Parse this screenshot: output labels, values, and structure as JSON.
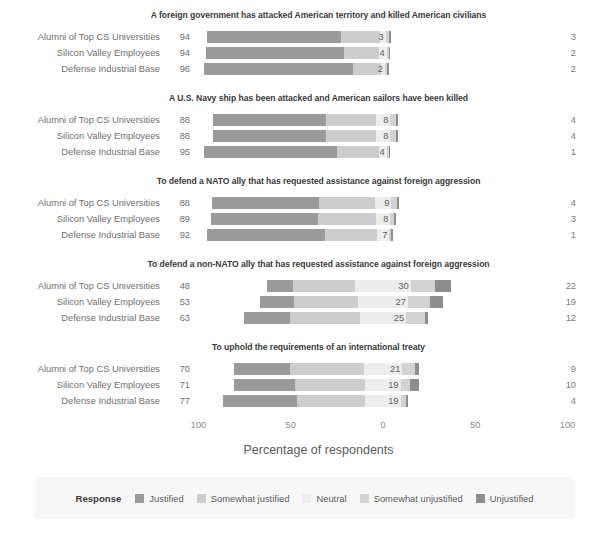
{
  "chart_data": {
    "type": "bar",
    "subtype": "diverging-stacked-likert",
    "title": "",
    "xlabel": "Percentage of respondents",
    "ylabel": "",
    "xticks": [
      {
        "label": "100",
        "value": -100
      },
      {
        "label": "50",
        "value": -50
      },
      {
        "label": "0",
        "value": 0
      },
      {
        "label": "50",
        "value": 50
      },
      {
        "label": "100",
        "value": 100
      }
    ],
    "xlim": [
      -100,
      100
    ],
    "grid": false,
    "legend_position": "bottom",
    "legend_title": "Response",
    "categories": [
      "Justified",
      "Somewhat justified",
      "Neutral",
      "Somewhat unjustified",
      "Unjustified"
    ],
    "category_colors": [
      "#9a9a9a",
      "#cdcdcd",
      "#ededed",
      "#d2d2d2",
      "#8d8d8d"
    ],
    "groups": [
      "Alumni of Top CS Universities",
      "Silicon Valley Employees",
      "Defense Industrial Base"
    ],
    "panels": [
      {
        "title": "A foreign government has attacked American territory and killed American civilians",
        "rows": [
          {
            "group": "Alumni of Top CS Universities",
            "left_total": 94,
            "neutral": 3,
            "right_total": 3,
            "values": {
              "justified": 73,
              "somewhat_justified": 21,
              "neutral": 3,
              "somewhat_unjustified": 2,
              "unjustified": 1
            }
          },
          {
            "group": "Silicon Valley Employees",
            "left_total": 94,
            "neutral": 4,
            "right_total": 2,
            "values": {
              "justified": 75,
              "somewhat_justified": 19,
              "neutral": 4,
              "somewhat_unjustified": 1,
              "unjustified": 1
            }
          },
          {
            "group": "Defense Industrial Base",
            "left_total": 96,
            "neutral": 2,
            "right_total": 2,
            "values": {
              "justified": 81,
              "somewhat_justified": 15,
              "neutral": 2,
              "somewhat_unjustified": 1,
              "unjustified": 1
            }
          }
        ]
      },
      {
        "title": "A U.S. Navy ship has been attacked and American sailors have been killed",
        "rows": [
          {
            "group": "Alumni of Top CS Universities",
            "left_total": 88,
            "neutral": 8,
            "right_total": 4,
            "values": {
              "justified": 61,
              "somewhat_justified": 27,
              "neutral": 8,
              "somewhat_unjustified": 3,
              "unjustified": 1
            }
          },
          {
            "group": "Silicon Valley Employees",
            "left_total": 88,
            "neutral": 8,
            "right_total": 4,
            "values": {
              "justified": 61,
              "somewhat_justified": 27,
              "neutral": 8,
              "somewhat_unjustified": 3,
              "unjustified": 1
            }
          },
          {
            "group": "Defense Industrial Base",
            "left_total": 95,
            "neutral": 4,
            "right_total": 1,
            "values": {
              "justified": 72,
              "somewhat_justified": 23,
              "neutral": 4,
              "somewhat_unjustified": 1,
              "unjustified": 0
            }
          }
        ]
      },
      {
        "title": "To defend a NATO ally that has requested assistance against foreign aggression",
        "rows": [
          {
            "group": "Alumni of Top CS Universities",
            "left_total": 88,
            "neutral": 9,
            "right_total": 4,
            "values": {
              "justified": 58,
              "somewhat_justified": 30,
              "neutral": 9,
              "somewhat_unjustified": 3,
              "unjustified": 1
            }
          },
          {
            "group": "Silicon Valley Employees",
            "left_total": 89,
            "neutral": 8,
            "right_total": 3,
            "values": {
              "justified": 58,
              "somewhat_justified": 31,
              "neutral": 8,
              "somewhat_unjustified": 2,
              "unjustified": 1
            }
          },
          {
            "group": "Defense Industrial Base",
            "left_total": 92,
            "neutral": 7,
            "right_total": 1,
            "values": {
              "justified": 64,
              "somewhat_justified": 28,
              "neutral": 7,
              "somewhat_unjustified": 1,
              "unjustified": 0
            }
          }
        ]
      },
      {
        "title": "To defend a non-NATO ally that has requested assistance against foreign aggression",
        "rows": [
          {
            "group": "Alumni of Top CS Universities",
            "left_total": 48,
            "neutral": 30,
            "right_total": 22,
            "values": {
              "justified": 14,
              "somewhat_justified": 34,
              "neutral": 30,
              "somewhat_unjustified": 13,
              "unjustified": 9
            }
          },
          {
            "group": "Silicon Valley Employees",
            "left_total": 53,
            "neutral": 27,
            "right_total": 19,
            "values": {
              "justified": 18,
              "somewhat_justified": 35,
              "neutral": 27,
              "somewhat_unjustified": 12,
              "unjustified": 7
            }
          },
          {
            "group": "Defense Industrial Base",
            "left_total": 63,
            "neutral": 25,
            "right_total": 12,
            "values": {
              "justified": 25,
              "somewhat_justified": 38,
              "neutral": 25,
              "somewhat_unjustified": 10,
              "unjustified": 2
            }
          }
        ]
      },
      {
        "title": "To uphold the requirements of an international treaty",
        "rows": [
          {
            "group": "Alumni of Top CS Universities",
            "left_total": 70,
            "neutral": 21,
            "right_total": 9,
            "values": {
              "justified": 30,
              "somewhat_justified": 40,
              "neutral": 21,
              "somewhat_unjustified": 7,
              "unjustified": 2
            }
          },
          {
            "group": "Silicon Valley Employees",
            "left_total": 71,
            "neutral": 19,
            "right_total": 10,
            "values": {
              "justified": 33,
              "somewhat_justified": 38,
              "neutral": 19,
              "somewhat_unjustified": 5,
              "unjustified": 5
            }
          },
          {
            "group": "Defense Industrial Base",
            "left_total": 77,
            "neutral": 19,
            "right_total": 4,
            "values": {
              "justified": 40,
              "somewhat_justified": 37,
              "neutral": 19,
              "somewhat_unjustified": 3,
              "unjustified": 1
            }
          }
        ]
      }
    ]
  },
  "axis": {
    "title": "Percentage of respondents"
  },
  "legend": {
    "title": "Response",
    "items": [
      {
        "label": "Justified",
        "color": "#9a9a9a"
      },
      {
        "label": "Somewhat justified",
        "color": "#cdcdcd"
      },
      {
        "label": "Neutral",
        "color": "#ededed"
      },
      {
        "label": "Somewhat unjustified",
        "color": "#d2d2d2"
      },
      {
        "label": "Unjustified",
        "color": "#8d8d8d"
      }
    ]
  }
}
